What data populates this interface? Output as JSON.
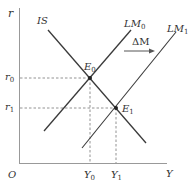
{
  "diagram": {
    "type": "IS-LM",
    "axes": {
      "y_label": "r",
      "x_label": "Y",
      "origin_label": "O"
    },
    "curves": {
      "is": {
        "label": "IS"
      },
      "lm0": {
        "label_main": "LM",
        "label_sub": "0"
      },
      "lm1": {
        "label_main": "LM",
        "label_sub": "1"
      }
    },
    "shift": {
      "label": "ΔM",
      "direction": "right"
    },
    "equilibria": {
      "e0": {
        "label_main": "E",
        "label_sub": "0"
      },
      "e1": {
        "label_main": "E",
        "label_sub": "1"
      }
    },
    "ticks": {
      "r0": {
        "main": "r",
        "sub": "0"
      },
      "r1": {
        "main": "r",
        "sub": "1"
      },
      "y0": {
        "main": "Y",
        "sub": "0"
      },
      "y1": {
        "main": "Y",
        "sub": "1"
      }
    },
    "colors": {
      "line": "#3a3a3a",
      "dash": "#777777",
      "text": "#333333"
    }
  }
}
